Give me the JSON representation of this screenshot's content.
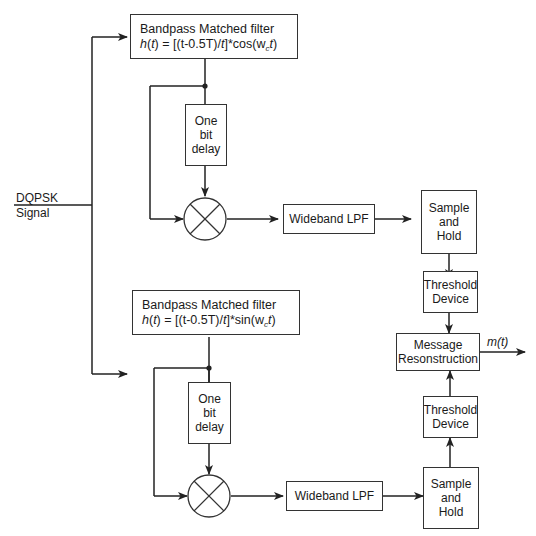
{
  "diagram": {
    "input": {
      "line1": "DQPSK",
      "line2": "Signal"
    },
    "upper_branch": {
      "filter": {
        "title": "Bandpass Matched filter",
        "eq_prefix": "h",
        "eq_arg": "t",
        "eq_body": " =  [(t-0.5T)/",
        "eq_t": "t",
        "eq_func": "]*cos(w",
        "eq_sub": "c",
        "eq_end_t": "t",
        "eq_close": ")"
      },
      "delay": {
        "line1": "One",
        "line2": "bit",
        "line3": "delay"
      },
      "mixer": "multiplier",
      "lpf": "Wideband LPF",
      "sample_hold": {
        "line1": "Sample",
        "line2": "and",
        "line3": "Hold"
      },
      "threshold": {
        "line1": "Threshold",
        "line2": "Device"
      }
    },
    "lower_branch": {
      "filter": {
        "title": "Bandpass Matched filter",
        "eq_prefix": "h",
        "eq_arg": "t",
        "eq_body": " =  [(t-0.5T)/",
        "eq_t": "t",
        "eq_func": "]*sin(w",
        "eq_sub": "c",
        "eq_end_t": "t",
        "eq_close": ")"
      },
      "delay": {
        "line1": "One",
        "line2": "bit",
        "line3": "delay"
      },
      "mixer": "multiplier",
      "lpf": "Wideband LPF",
      "sample_hold": {
        "line1": "Sample",
        "line2": "and",
        "line3": "Hold"
      },
      "threshold": {
        "line1": "Threshold",
        "line2": "Device"
      }
    },
    "reconstruction": {
      "line1": "Message",
      "line2": "Resonstruction"
    },
    "output": {
      "label": "m(t)"
    },
    "colors": {
      "line": "#222222",
      "box_border": "#333333",
      "background": "#ffffff"
    }
  }
}
